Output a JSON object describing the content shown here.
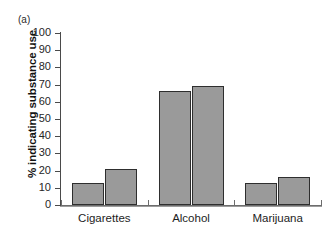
{
  "figure": {
    "panel_label": "(a)",
    "background_color": "#ffffff"
  },
  "axes": {
    "y_title": "% indicating substance use",
    "y_ticks": [
      "100",
      "90",
      "80",
      "70",
      "60",
      "50",
      "40",
      "30",
      "20",
      "10",
      "0"
    ],
    "x_groups": [
      "Cigarettes",
      "Alcohol",
      "Marijuana"
    ]
  },
  "style": {
    "bar_fill": "#9a9a9a",
    "bar_stroke": "#2e2e2e",
    "axis_color": "#4a4a4a"
  },
  "chart_data": {
    "type": "bar",
    "title": "",
    "subtitle": "",
    "xlabel": "",
    "ylabel": "% indicating substance use",
    "categories": [
      "Cigarettes",
      "Alcohol",
      "Marijuana"
    ],
    "series": [
      {
        "name": "series-1",
        "values": [
          13,
          66,
          13
        ]
      },
      {
        "name": "series-2",
        "values": [
          21,
          69,
          16
        ]
      }
    ],
    "ylim": [
      0,
      100
    ],
    "ytick_values": [
      0,
      10,
      20,
      30,
      40,
      50,
      60,
      70,
      80,
      90,
      100
    ],
    "grid": false,
    "legend": "none",
    "annotations": [
      "(a)"
    ]
  }
}
